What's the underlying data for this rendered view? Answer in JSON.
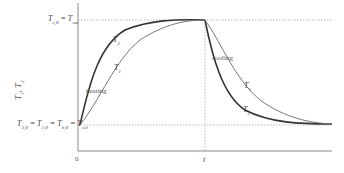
{
  "diagram": {
    "y_axis_label": {
      "main": "T",
      "sub1": "1",
      "sep": ", ",
      "main2": "T",
      "sub2": "2"
    },
    "x_axis": {
      "origin_label": "0",
      "time_label": "t"
    },
    "top_level_label": {
      "a": "T",
      "a_sub": "c,0",
      "eq": " = ",
      "b": "T",
      "b_sub": "sat"
    },
    "bottom_level_label": {
      "a": "T",
      "a_sub": "2,0",
      "b": "T",
      "b_sub": "1,0",
      "c": "T",
      "c_sub": "h,0",
      "d": "T",
      "d_sub": "col",
      "eq": " = "
    },
    "annotations": {
      "heating": "heating",
      "cooling": "cooling",
      "curve_T2_heating": {
        "main": "T",
        "sub": "2"
      },
      "curve_T1_heating": {
        "main": "T",
        "sub": "1"
      },
      "curve_T1_cooling": {
        "main": "T",
        "sub": "1"
      },
      "curve_T2_cooling": {
        "main": "T",
        "sub": "2"
      }
    },
    "colors": {
      "axis": "#888888",
      "dotted": "#aaaaaa",
      "curve_T2": "#333333",
      "curve_T1": "#777777"
    }
  }
}
